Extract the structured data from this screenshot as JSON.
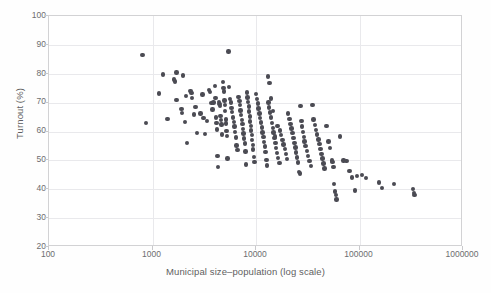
{
  "chart_data": {
    "type": "scatter",
    "title": "",
    "xlabel": "Municipal size–population (log scale)",
    "ylabel": "Turnout (%)",
    "xscale": "log",
    "yscale": "linear",
    "xlim": [
      100,
      1000000
    ],
    "ylim": [
      20,
      100
    ],
    "xticks": [
      100,
      1000,
      10000,
      100000,
      1000000
    ],
    "xtick_labels": [
      "100",
      "1000",
      "10000",
      "100000",
      "1000000"
    ],
    "yticks": [
      20,
      30,
      40,
      50,
      60,
      70,
      80,
      90,
      100
    ],
    "ytick_labels": [
      "20",
      "30",
      "40",
      "50",
      "60",
      "70",
      "80",
      "90",
      "100"
    ],
    "grid": "horizontal-and-vertical-light",
    "legend": null,
    "marker_color": "#4b4b53",
    "marker_size_px": 4.4,
    "series": [
      {
        "name": "Municipalities",
        "points": [
          [
            800,
            86.4
          ],
          [
            870,
            63.0
          ],
          [
            1270,
            79.7
          ],
          [
            1150,
            73.2
          ],
          [
            1390,
            64.3
          ],
          [
            1700,
            80.5
          ],
          [
            1640,
            77.3
          ],
          [
            1620,
            78.0
          ],
          [
            1700,
            71.0
          ],
          [
            1980,
            79.4
          ],
          [
            1900,
            67.8
          ],
          [
            1930,
            66.4
          ],
          [
            2100,
            72.4
          ],
          [
            2060,
            63.2
          ],
          [
            2150,
            56.0
          ],
          [
            2330,
            74.0
          ],
          [
            2380,
            73.3
          ],
          [
            2420,
            71.7
          ],
          [
            2500,
            65.9
          ],
          [
            2600,
            68.4
          ],
          [
            2700,
            59.5
          ],
          [
            2900,
            66.2
          ],
          [
            3050,
            72.8
          ],
          [
            3100,
            64.6
          ],
          [
            3200,
            59.2
          ],
          [
            3350,
            63.6
          ],
          [
            3500,
            74.4
          ],
          [
            3600,
            73.6
          ],
          [
            3700,
            69.9
          ],
          [
            3800,
            67.6
          ],
          [
            3900,
            70.1
          ],
          [
            4000,
            75.8
          ],
          [
            4050,
            71.5
          ],
          [
            4100,
            64.8
          ],
          [
            4150,
            63.0
          ],
          [
            4200,
            60.7
          ],
          [
            4250,
            51.6
          ],
          [
            4300,
            47.8
          ],
          [
            4400,
            70.3
          ],
          [
            4450,
            69.5
          ],
          [
            4500,
            68.9
          ],
          [
            4550,
            65.4
          ],
          [
            4600,
            63.9
          ],
          [
            4650,
            62.4
          ],
          [
            4700,
            58.9
          ],
          [
            4800,
            77.2
          ],
          [
            4850,
            75.0
          ],
          [
            4900,
            73.9
          ],
          [
            4950,
            70.8
          ],
          [
            5000,
            69.2
          ],
          [
            5050,
            67.0
          ],
          [
            5100,
            64.2
          ],
          [
            5150,
            62.8
          ],
          [
            5200,
            60.2
          ],
          [
            5250,
            58.4
          ],
          [
            5300,
            50.6
          ],
          [
            5400,
            87.7
          ],
          [
            5500,
            75.5
          ],
          [
            5600,
            71.2
          ],
          [
            5700,
            70.0
          ],
          [
            5800,
            68.1
          ],
          [
            5900,
            66.7
          ],
          [
            6000,
            64.9
          ],
          [
            6100,
            63.3
          ],
          [
            6200,
            61.8
          ],
          [
            6300,
            59.8
          ],
          [
            6400,
            57.9
          ],
          [
            6500,
            55.1
          ],
          [
            6600,
            53.7
          ],
          [
            6800,
            72.0
          ],
          [
            6900,
            70.6
          ],
          [
            7000,
            69.1
          ],
          [
            7100,
            67.3
          ],
          [
            7200,
            65.8
          ],
          [
            7300,
            64.0
          ],
          [
            7400,
            62.5
          ],
          [
            7500,
            60.9
          ],
          [
            7600,
            59.3
          ],
          [
            7700,
            57.6
          ],
          [
            7800,
            55.9
          ],
          [
            7900,
            53.1
          ],
          [
            8000,
            48.6
          ],
          [
            8200,
            73.5
          ],
          [
            8300,
            71.8
          ],
          [
            8400,
            70.2
          ],
          [
            8500,
            68.6
          ],
          [
            8600,
            66.9
          ],
          [
            8700,
            65.2
          ],
          [
            8800,
            63.5
          ],
          [
            8900,
            61.9
          ],
          [
            9000,
            60.3
          ],
          [
            9100,
            58.7
          ],
          [
            9200,
            57.0
          ],
          [
            9300,
            55.4
          ],
          [
            9400,
            53.8
          ],
          [
            9500,
            51.1
          ],
          [
            9700,
            49.4
          ],
          [
            10000,
            73.0
          ],
          [
            10200,
            71.3
          ],
          [
            10400,
            69.7
          ],
          [
            10600,
            68.0
          ],
          [
            10800,
            66.3
          ],
          [
            11000,
            64.7
          ],
          [
            11200,
            63.1
          ],
          [
            11400,
            61.4
          ],
          [
            11600,
            59.7
          ],
          [
            11800,
            58.1
          ],
          [
            12000,
            56.4
          ],
          [
            12200,
            54.8
          ],
          [
            12400,
            52.9
          ],
          [
            12600,
            50.2
          ],
          [
            12800,
            48.2
          ],
          [
            13000,
            79.0
          ],
          [
            13200,
            70.1
          ],
          [
            13400,
            68.3
          ],
          [
            13600,
            66.6
          ],
          [
            13900,
            64.8
          ],
          [
            14200,
            63.0
          ],
          [
            14500,
            61.3
          ],
          [
            14800,
            59.6
          ],
          [
            15100,
            57.8
          ],
          [
            15400,
            56.1
          ],
          [
            15700,
            54.3
          ],
          [
            16000,
            52.6
          ],
          [
            16400,
            50.9
          ],
          [
            16800,
            49.2
          ],
          [
            13500,
            76.8
          ],
          [
            14000,
            71.4
          ],
          [
            14600,
            67.0
          ],
          [
            15200,
            58.3
          ],
          [
            16200,
            62.0
          ],
          [
            17000,
            60.4
          ],
          [
            17500,
            58.8
          ],
          [
            18000,
            57.1
          ],
          [
            18500,
            55.5
          ],
          [
            19000,
            53.9
          ],
          [
            19500,
            52.2
          ],
          [
            20000,
            50.5
          ],
          [
            20500,
            66.2
          ],
          [
            21000,
            64.4
          ],
          [
            21500,
            62.7
          ],
          [
            22000,
            61.0
          ],
          [
            22500,
            59.4
          ],
          [
            23000,
            57.7
          ],
          [
            23500,
            56.0
          ],
          [
            24000,
            54.4
          ],
          [
            24500,
            52.7
          ],
          [
            25000,
            51.0
          ],
          [
            25500,
            49.3
          ],
          [
            26000,
            46.0
          ],
          [
            26500,
            45.5
          ],
          [
            27000,
            68.8
          ],
          [
            27500,
            63.7
          ],
          [
            28000,
            61.7
          ],
          [
            28500,
            59.9
          ],
          [
            29000,
            58.2
          ],
          [
            29500,
            56.5
          ],
          [
            30000,
            54.9
          ],
          [
            31000,
            53.2
          ],
          [
            32000,
            51.5
          ],
          [
            33000,
            49.8
          ],
          [
            34000,
            48.1
          ],
          [
            35000,
            69.2
          ],
          [
            36000,
            64.1
          ],
          [
            37000,
            62.2
          ],
          [
            38000,
            60.6
          ],
          [
            39000,
            58.9
          ],
          [
            40000,
            57.2
          ],
          [
            41000,
            55.6
          ],
          [
            42000,
            53.9
          ],
          [
            43000,
            52.3
          ],
          [
            44000,
            50.6
          ],
          [
            45000,
            48.9
          ],
          [
            46000,
            47.2
          ],
          [
            48000,
            62.0
          ],
          [
            50000,
            56.6
          ],
          [
            52000,
            54.2
          ],
          [
            54000,
            50.0
          ],
          [
            55000,
            49.5
          ],
          [
            56000,
            47.8
          ],
          [
            57000,
            41.8
          ],
          [
            58000,
            39.2
          ],
          [
            59000,
            38.0
          ],
          [
            60000,
            36.4
          ],
          [
            65000,
            58.3
          ],
          [
            70000,
            50.0
          ],
          [
            75000,
            49.8
          ],
          [
            80000,
            46.3
          ],
          [
            85000,
            44.1
          ],
          [
            90000,
            39.6
          ],
          [
            95000,
            44.6
          ],
          [
            105000,
            44.9
          ],
          [
            115000,
            43.9
          ],
          [
            155000,
            42.4
          ],
          [
            165000,
            40.4
          ],
          [
            215000,
            41.8
          ],
          [
            330000,
            40.0
          ],
          [
            335000,
            38.8
          ],
          [
            340000,
            38.0
          ]
        ]
      }
    ]
  },
  "axis": {
    "x_tick_labels": [
      "100",
      "1000",
      "10000",
      "100000",
      "1000000"
    ],
    "y_tick_labels": [
      "100",
      "90",
      "80",
      "70",
      "60",
      "50",
      "40",
      "30",
      "20"
    ],
    "x_title": "Municipal size–population (log scale)",
    "y_title": "Turnout (%)"
  }
}
